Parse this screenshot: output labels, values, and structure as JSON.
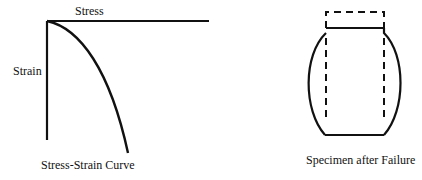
{
  "left_figure": {
    "x_axis_label": "Stress",
    "y_axis_label": "Strain",
    "caption": "Stress-Strain Curve"
  },
  "right_figure": {
    "caption": "Specimen after Failure"
  },
  "colors": {
    "stroke": "#111111",
    "background": "#ffffff"
  }
}
